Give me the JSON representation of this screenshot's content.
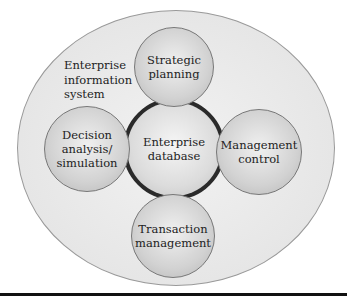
{
  "diagram": {
    "outer_label": "Enterprise\ninformation\nsystem",
    "center": "Enterprise\ndatabase",
    "nodes": {
      "top": "Strategic\nplanning",
      "left": "Decision\nanalysis/\nsimulation",
      "right": "Management\ncontrol",
      "bottom": "Transaction\nmanagement"
    }
  }
}
